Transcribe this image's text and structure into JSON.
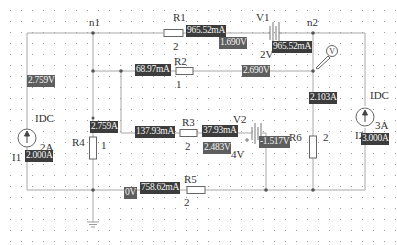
{
  "schematic": {
    "nodes": [
      {
        "id": "n1",
        "label": "n1"
      },
      {
        "id": "n2",
        "label": "n2"
      }
    ],
    "components": {
      "R1": {
        "name": "R1",
        "value": "2"
      },
      "R2": {
        "name": "R2",
        "value": "1"
      },
      "R3": {
        "name": "R3",
        "value": "2"
      },
      "R4": {
        "name": "R4",
        "value": "1"
      },
      "R5": {
        "name": "R5",
        "value": "2"
      },
      "R6": {
        "name": "R6",
        "value": "2"
      },
      "V1": {
        "name": "V1",
        "value": "2V"
      },
      "V2": {
        "name": "V2",
        "value": "4V"
      },
      "I1": {
        "name": "I1",
        "type": "IDC",
        "value": "2A"
      },
      "I2": {
        "name": "I2",
        "type": "IDC",
        "value": "3A"
      },
      "voltmeter": {
        "symbol": "V"
      }
    },
    "probes": {
      "r1_current": "965.52mA",
      "n1_right_voltage": "1.690V",
      "v1_current": "965.52mA",
      "r2_current": "68.97mA",
      "n2_r2_voltage": "2.690V",
      "left_voltage": "2.759V",
      "r3_left_current": "137.93mA",
      "r3_right_current": "37.93mA",
      "v2_voltage": "2.483V",
      "r4_current": "2.759A",
      "r6_current": "2.103A",
      "v2_right_voltage": "-1.517V",
      "i1_current": "2.000A",
      "i2_current": "3.000A",
      "ground_voltage": "0V",
      "r5_current": "758.62mA"
    }
  },
  "colors": {
    "wire": "#b0b0b0",
    "probe_current_bg": "#3c3c3c",
    "probe_voltage_bg": "#5e5e5e",
    "grid_dot": "#9a9a9a",
    "background": "#ffffff"
  }
}
